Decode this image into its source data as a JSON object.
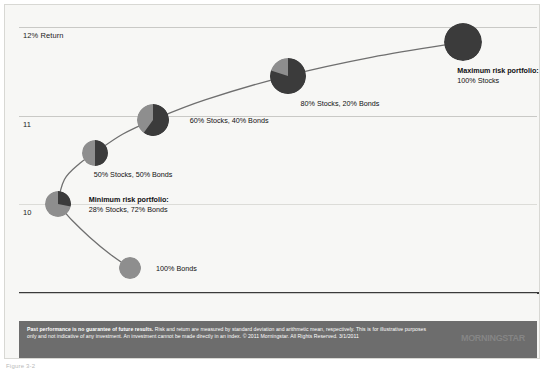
{
  "chart_data": {
    "type": "scatter",
    "title": "",
    "subtitle": "",
    "xlabel": "Risk (standard deviation)",
    "ylabel": "Return (arithmetic mean)",
    "xlim": [
      9.3,
      19.6
    ],
    "ylim": [
      8.75,
      12.2
    ],
    "grid": true,
    "legend_position": "none",
    "x_ticks": [
      {
        "value": 10,
        "label": "10% Risk"
      },
      {
        "value": 11,
        "label": "11"
      },
      {
        "value": 12,
        "label": "12"
      },
      {
        "value": 13,
        "label": "13"
      },
      {
        "value": 14,
        "label": "14"
      },
      {
        "value": 15,
        "label": "15"
      },
      {
        "value": 16,
        "label": "16"
      },
      {
        "value": 17,
        "label": "17"
      },
      {
        "value": 18,
        "label": "18"
      },
      {
        "value": 19,
        "label": "19"
      }
    ],
    "y_ticks": [
      {
        "value": 12,
        "label": "12% Return"
      },
      {
        "value": 11,
        "label": "11"
      },
      {
        "value": 10,
        "label": "10"
      },
      {
        "value": 9,
        "label": "9"
      }
    ],
    "series_name": "Efficient frontier",
    "points": [
      {
        "name": "100% Bonds",
        "label": "100% Bonds",
        "label_bold": "",
        "x": 11.5,
        "y": 9.28,
        "stocks_pct": 0,
        "bonds_pct": 100,
        "radius": 11,
        "label_dx": 15,
        "label_dy": -4
      },
      {
        "name": "Minimum risk portfolio",
        "label": "28% Stocks, 72% Bonds",
        "label_bold": "Minimum risk portfolio:",
        "x": 10.07,
        "y": 10.0,
        "stocks_pct": 28,
        "bonds_pct": 72,
        "radius": 13,
        "label_dx": 18,
        "label_dy": -9
      },
      {
        "name": "50/50 portfolio",
        "label": "50% Stocks, 50% Bonds",
        "label_bold": "",
        "x": 10.8,
        "y": 10.58,
        "stocks_pct": 50,
        "bonds_pct": 50,
        "radius": 13,
        "label_dx": -14,
        "label_dy": 17
      },
      {
        "name": "60/40 portfolio",
        "label": "60% Stocks, 40% Bonds",
        "label_bold": "",
        "x": 11.95,
        "y": 10.95,
        "stocks_pct": 60,
        "bonds_pct": 40,
        "radius": 16,
        "label_dx": 21,
        "label_dy": -4
      },
      {
        "name": "80/20 portfolio",
        "label": "80% Stocks, 20% Bonds",
        "label_bold": "",
        "x": 14.62,
        "y": 11.45,
        "stocks_pct": 80,
        "bonds_pct": 20,
        "radius": 18,
        "label_dx": -5,
        "label_dy": 23
      },
      {
        "name": "Maximum risk portfolio",
        "label": "100% Stocks",
        "label_bold": "Maximum risk portfolio:",
        "x": 18.1,
        "y": 11.83,
        "stocks_pct": 100,
        "bonds_pct": 0,
        "radius": 19,
        "label_dx": -25,
        "label_dy": 24
      }
    ],
    "curve_points": [
      {
        "x": 11.5,
        "y": 9.28
      },
      {
        "x": 11.1,
        "y": 9.44
      },
      {
        "x": 10.7,
        "y": 9.63
      },
      {
        "x": 10.35,
        "y": 9.82
      },
      {
        "x": 10.12,
        "y": 9.97
      },
      {
        "x": 10.07,
        "y": 10.0
      },
      {
        "x": 10.2,
        "y": 10.28
      },
      {
        "x": 10.5,
        "y": 10.46
      },
      {
        "x": 10.8,
        "y": 10.58
      },
      {
        "x": 11.35,
        "y": 10.79
      },
      {
        "x": 11.95,
        "y": 10.95
      },
      {
        "x": 13.0,
        "y": 11.18
      },
      {
        "x": 14.62,
        "y": 11.45
      },
      {
        "x": 16.3,
        "y": 11.66
      },
      {
        "x": 18.1,
        "y": 11.83
      }
    ],
    "colors": {
      "stocks": "#3b3b3b",
      "bonds": "#8e8e8e",
      "curve": "#6f6f6f",
      "gridline": "#c9c9c6",
      "axis": "#3a3a3a",
      "plot_background": "#f7f7f5",
      "footer_band": "#6d6d6d",
      "text": "#111111"
    }
  },
  "footer": {
    "disclaimer_bold": "Past performance is no guarantee of future results.",
    "disclaimer_rest": " Risk and return are measured by standard deviation and arithmetic mean, respectively. This is for illustrative purposes only and not indicative of any investment. An investment cannot be made directly in an index. © 2011 Morningstar. All Rights Reserved. 3/1/2011",
    "logo": "MΟRNINGSTAR"
  },
  "caption": "Figure 3-2"
}
